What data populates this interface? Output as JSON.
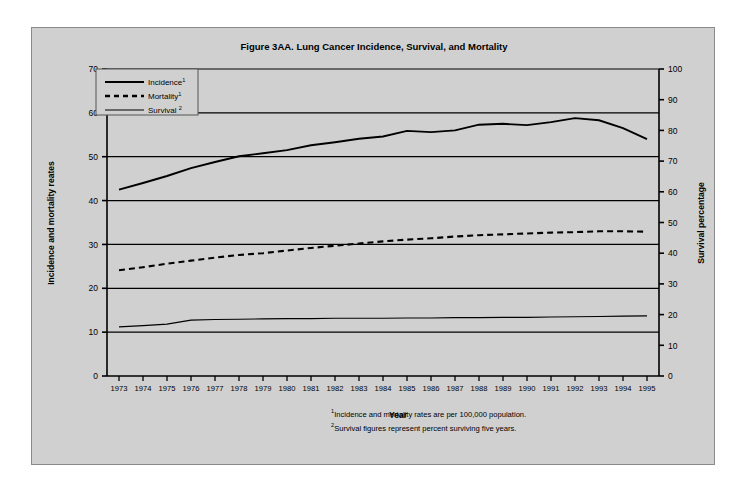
{
  "figure": {
    "title": "Figure 3AA. Lung Cancer Incidence, Survival, and Mortality",
    "xlabel": "Year",
    "ylabel_left": "Incidence and mortality reates",
    "ylabel_right": "Survival percentage",
    "footnote_1_marker": "1",
    "footnote_1": "Incidence and mortality rates are per 100,000 population.",
    "footnote_2_marker": "2",
    "footnote_2": "Survival figures represent percent surviving five years.",
    "panel_color": "#d0d0d0",
    "line_color": "#000000"
  },
  "legend": {
    "items": [
      {
        "label": "Incidence",
        "sup": "1",
        "style": "solid-thick"
      },
      {
        "label": "Mortality",
        "sup": "1",
        "style": "dashed"
      },
      {
        "label": "Survival ",
        "sup": "2",
        "style": "solid-thin"
      }
    ]
  },
  "chart_data": {
    "type": "line",
    "title": "Figure 3AA. Lung Cancer Incidence, Survival, and Mortality",
    "xlabel": "Year",
    "ylabel": "Incidence and mortality reates",
    "ylabel_secondary": "Survival percentage",
    "grid": true,
    "legend_position": "top-left",
    "x": [
      1973,
      1974,
      1975,
      1976,
      1977,
      1978,
      1979,
      1980,
      1981,
      1982,
      1983,
      1984,
      1985,
      1986,
      1987,
      1988,
      1989,
      1990,
      1991,
      1992,
      1993,
      1994,
      1995
    ],
    "xticklabels": [
      "1973",
      "1974",
      "1975",
      "1976",
      "1977",
      "1978",
      "1979",
      "1980",
      "1981",
      "1982",
      "1983",
      "1984",
      "1985",
      "1986",
      "1987",
      "1988",
      "1989",
      "1990",
      "1991",
      "1992",
      "1993",
      "1994",
      "1995"
    ],
    "ylim": [
      0,
      70
    ],
    "yticks": [
      0,
      10,
      20,
      30,
      40,
      50,
      60,
      70
    ],
    "yticklabels": [
      "0",
      "10",
      "20",
      "30",
      "40",
      "50",
      "60",
      "70"
    ],
    "ylim_secondary": [
      0,
      100
    ],
    "yticks_secondary": [
      0,
      10,
      20,
      30,
      40,
      50,
      60,
      70,
      80,
      90,
      100
    ],
    "yticklabels_secondary": [
      "0",
      "10",
      "20",
      "30",
      "40",
      "50",
      "60",
      "70",
      "80",
      "90",
      "100"
    ],
    "series": [
      {
        "name": "Incidence",
        "axis": "left",
        "style": "solid-thick",
        "values": [
          42.5,
          44.0,
          45.6,
          47.4,
          48.8,
          50.1,
          50.8,
          51.5,
          52.6,
          53.3,
          54.1,
          54.6,
          55.9,
          55.6,
          56.0,
          57.3,
          57.5,
          57.2,
          57.9,
          58.8,
          58.3,
          56.5,
          54.0
        ]
      },
      {
        "name": "Mortality",
        "axis": "left",
        "style": "dashed",
        "values": [
          24.1,
          24.8,
          25.6,
          26.3,
          27.0,
          27.6,
          28.0,
          28.6,
          29.2,
          29.7,
          30.2,
          30.7,
          31.1,
          31.4,
          31.8,
          32.1,
          32.3,
          32.5,
          32.7,
          32.8,
          33.0,
          33.0,
          32.9
        ]
      },
      {
        "name": "Survival",
        "axis": "right",
        "style": "solid-thin",
        "values": [
          16.0,
          16.4,
          16.9,
          18.2,
          18.4,
          18.5,
          18.6,
          18.7,
          18.7,
          18.8,
          18.8,
          18.8,
          18.9,
          18.9,
          19.0,
          19.0,
          19.1,
          19.1,
          19.2,
          19.3,
          19.4,
          19.5,
          19.6
        ]
      }
    ]
  }
}
